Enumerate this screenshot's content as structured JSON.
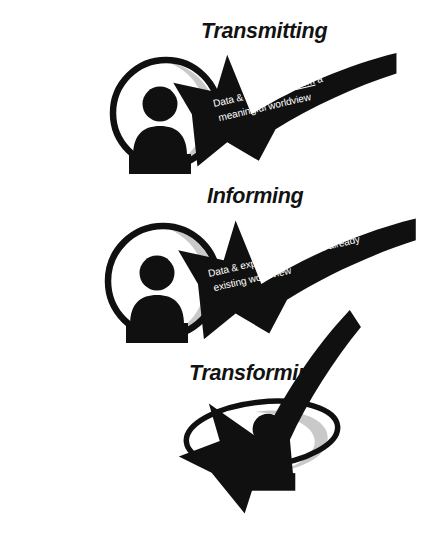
{
  "document": {
    "title": "Transmitting / Informing / Transforming worldview diagram",
    "background_color": "#ffffff",
    "ink_color": "#101010",
    "accent_gray": "#c9c9c9",
    "label_text_color": "#ffffff"
  },
  "panels": [
    {
      "id": "transmitting",
      "title": "Transmitting",
      "label_line1_pre": "Data & experience ",
      "label_line1_emph": "form",
      "label_line1_post": " a",
      "label_line2": "meaningful worldview",
      "arrow_direction": "right-to-left",
      "figure": "person-in-circle"
    },
    {
      "id": "informing",
      "title": "Informing",
      "label_line1_pre": "Data & experience ",
      "label_line1_emph": "enter",
      "label_line1_post": " an already",
      "label_line2": "existing worldview",
      "arrow_direction": "right-to-left",
      "figure": "person-in-circle"
    },
    {
      "id": "transforming",
      "title": "Transforming",
      "label_line1_pre": "Data & experience ",
      "label_line1_emph": "alter",
      "label_line1_post": " an already",
      "label_line2": "existing worldview",
      "arrow_direction": "right-to-left-upward",
      "figure": "person-in-ellipse"
    }
  ]
}
